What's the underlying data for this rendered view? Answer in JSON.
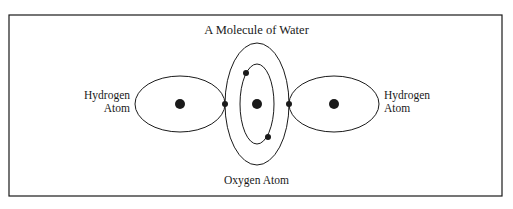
{
  "diagram": {
    "title": "A Molecule of Water",
    "labels": {
      "hydrogen_left_line1": "Hydrogen",
      "hydrogen_left_line2": "Atom",
      "hydrogen_right_line1": "Hydrogen",
      "hydrogen_right_line2": "Atom",
      "oxygen": "Oxygen Atom"
    },
    "colors": {
      "stroke": "#1a1a1a",
      "background": "#ffffff"
    },
    "nodes": [
      {
        "id": "hydrogen-left-nucleus"
      },
      {
        "id": "oxygen-nucleus"
      },
      {
        "id": "hydrogen-right-nucleus"
      },
      {
        "id": "shared-electron-left"
      },
      {
        "id": "shared-electron-right"
      },
      {
        "id": "inner-electron-top"
      },
      {
        "id": "inner-electron-bottom"
      }
    ]
  }
}
